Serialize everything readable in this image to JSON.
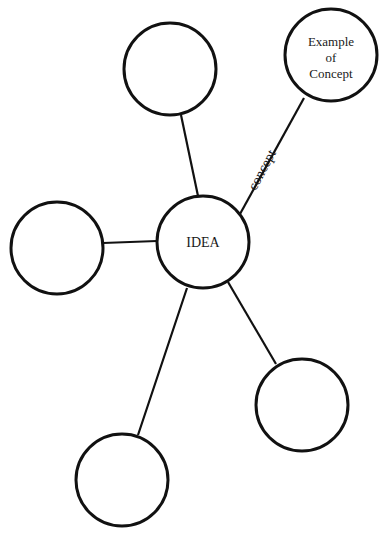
{
  "diagram": {
    "type": "concept-map",
    "center": {
      "id": "idea",
      "label": "IDEA",
      "cx": 203,
      "cy": 242,
      "r": 46
    },
    "nodes": [
      {
        "id": "top",
        "label": "",
        "cx": 170,
        "cy": 69,
        "r": 46
      },
      {
        "id": "left",
        "label": "",
        "cx": 57,
        "cy": 248,
        "r": 46
      },
      {
        "id": "example",
        "label_lines": [
          "Example",
          "of",
          "Concept"
        ],
        "cx": 331,
        "cy": 55,
        "r": 46
      },
      {
        "id": "bottom-right",
        "label": "",
        "cx": 302,
        "cy": 405,
        "r": 46
      },
      {
        "id": "bottom-left",
        "label": "",
        "cx": 122,
        "cy": 480,
        "r": 46
      }
    ],
    "edges": [
      {
        "from": "idea",
        "to": "top",
        "label": ""
      },
      {
        "from": "idea",
        "to": "left",
        "label": ""
      },
      {
        "from": "idea",
        "to": "example",
        "label": "concept"
      },
      {
        "from": "idea",
        "to": "bottom-right",
        "label": ""
      },
      {
        "from": "idea",
        "to": "bottom-left",
        "label": ""
      }
    ]
  },
  "labels": {
    "idea": "IDEA",
    "example_line1": "Example",
    "example_line2": "of",
    "example_line3": "Concept",
    "edge_concept": "concept"
  },
  "colors": {
    "stroke": "#111111",
    "background": "#ffffff",
    "text": "#1a1a1a"
  }
}
